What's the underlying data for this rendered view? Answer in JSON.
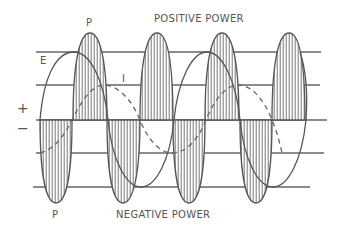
{
  "diagram": {
    "labels": {
      "positive_power": "POSITIVE POWER",
      "negative_power": "NEGATIVE POWER",
      "power_top": "P",
      "power_bottom": "P",
      "voltage": "E",
      "current": "I",
      "plus": "+",
      "minus": "−"
    },
    "colors": {
      "ink": "#555555",
      "background": "#ffffff"
    },
    "reference_lines_y": [
      52,
      85,
      120,
      153,
      187
    ],
    "curves": [
      {
        "name": "E",
        "style": "solid",
        "description": "voltage sine wave"
      },
      {
        "name": "I",
        "style": "dashed",
        "description": "current sine wave, lagging E"
      },
      {
        "name": "P",
        "style": "hatched",
        "description": "instantaneous power lobes (positive above axis, negative below)"
      }
    ]
  }
}
